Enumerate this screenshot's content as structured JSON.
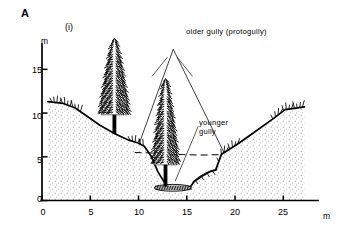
{
  "figure": {
    "panel_letter": "A",
    "panel_sub": "(i)",
    "type": "geomorphological-cross-section"
  },
  "axes": {
    "y_unit": "m",
    "x_unit": "m",
    "y_ticks": [
      "0",
      "5",
      "10",
      "15"
    ],
    "x_ticks": [
      "0",
      "5",
      "10",
      "15",
      "20",
      "25"
    ],
    "ylim": [
      0,
      17.5
    ],
    "xlim": [
      0,
      27.5
    ]
  },
  "annotations": {
    "older_gully": "older gully (protogully)",
    "younger_gully_line1": "younger",
    "younger_gully_line2": "gully"
  },
  "colors": {
    "ink": "#000000",
    "stipple": "#b9b9b9",
    "background": "#ffffff"
  },
  "chart_data": {
    "type": "line",
    "title": "",
    "xlabel": "m",
    "ylabel": "m",
    "xlim": [
      0,
      27.5
    ],
    "ylim": [
      0,
      17.5
    ],
    "grid": false,
    "legend": "none",
    "series": [
      {
        "name": "present ground surface",
        "style": "solid",
        "x": [
          0.6,
          2.2,
          3.4,
          4.6,
          6.0,
          7.6,
          9.0,
          9.9,
          10.6,
          11.3,
          12.0,
          12.9,
          14.3,
          15.4,
          15.8,
          16.6,
          17.4,
          18.0,
          18.6,
          20.2,
          22.0,
          24.0,
          25.2,
          27.2
        ],
        "y": [
          11.3,
          11.1,
          10.6,
          9.7,
          8.6,
          7.6,
          6.9,
          6.6,
          6.2,
          5.1,
          3.3,
          1.7,
          1.55,
          1.6,
          2.2,
          2.8,
          3.3,
          3.5,
          5.3,
          6.4,
          7.8,
          9.4,
          10.4,
          10.7
        ]
      },
      {
        "name": "older gully (protogully) outline",
        "style": "thin-solid",
        "x": [
          10.1,
          13.6,
          18.9
        ],
        "y": [
          6.6,
          17.3,
          5.4
        ]
      },
      {
        "name": "former fill surface",
        "style": "dashed",
        "x": [
          9.6,
          12.0,
          14.5,
          16.6,
          18.7
        ],
        "y": [
          5.5,
          5.4,
          5.25,
          5.2,
          5.25
        ]
      }
    ],
    "trees": [
      {
        "name": "left-conifer",
        "x": 7.5,
        "base_y": 7.6,
        "top_y": 18.6,
        "crown_width_m": 3.1
      },
      {
        "name": "right-conifer",
        "x": 12.8,
        "base_y": 1.6,
        "top_y": 14.0,
        "crown_width_m": 2.7
      }
    ],
    "vegetation_marks": [
      {
        "name": "left-plateau-grass",
        "x_from": 1.0,
        "x_to": 4.0,
        "y": 11.2
      },
      {
        "name": "right-plateau-grass",
        "x_from": 23.9,
        "x_to": 27.0,
        "y": 10.6
      },
      {
        "name": "inner-slope-grass",
        "x_from": 9.1,
        "x_to": 10.5,
        "y": 6.7
      },
      {
        "name": "right-bench-grass",
        "x_from": 18.3,
        "x_to": 20.3,
        "y": 5.6
      }
    ],
    "annotation_leaders": [
      {
        "label": "older gully (protogully)",
        "from_x": 13.0,
        "from_y": 16.4,
        "to_x": 11.4,
        "to_y": 14.2
      },
      {
        "label": "older gully (protogully)",
        "from_x": 14.0,
        "from_y": 16.4,
        "to_x": 15.6,
        "to_y": 14.2
      },
      {
        "label": "younger gully",
        "from_x": 16.2,
        "from_y": 8.5,
        "to_x": 13.8,
        "to_y": 2.2
      }
    ]
  }
}
